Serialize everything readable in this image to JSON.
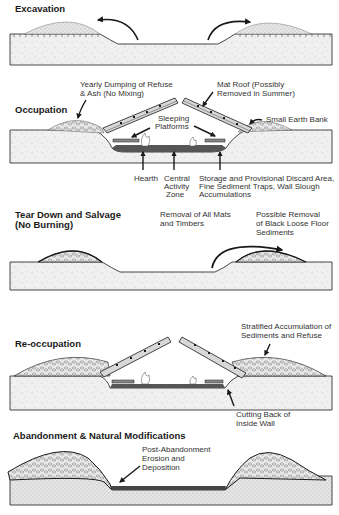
{
  "panels": [
    {
      "id": "excavation",
      "title": [
        "Excavation"
      ],
      "labels": []
    },
    {
      "id": "occupation",
      "title": [
        "Occupation"
      ],
      "labels": [
        {
          "lines": [
            "Yearly Dumping of Refuse",
            "& Ash (No Mixing)"
          ]
        },
        {
          "lines": [
            "Mat Roof (Possibly",
            "Removed in Summer)"
          ]
        },
        {
          "lines": [
            "Small Earth Bank"
          ]
        },
        {
          "lines": [
            "Sleeping",
            "Platforms"
          ]
        },
        {
          "lines": [
            "Hearth"
          ]
        },
        {
          "lines": [
            "Central",
            "Activity",
            "Zone"
          ]
        },
        {
          "lines": [
            "Storage and Provisional Discard Area,",
            "Fine Sediment Traps, Wall Slough",
            "Accumulations"
          ]
        }
      ]
    },
    {
      "id": "tear-down",
      "title": [
        "Tear Down and Salvage",
        "(No Burning)"
      ],
      "labels": [
        {
          "lines": [
            "Removal of All Mats",
            "and Timbers"
          ]
        },
        {
          "lines": [
            "Possible Removal",
            "of Black Loose Floor",
            "Sediments"
          ]
        }
      ]
    },
    {
      "id": "re-occupation",
      "title": [
        "Re-occupation"
      ],
      "labels": [
        {
          "lines": [
            "Stratified Accumulation of",
            "Sediments and Refuse"
          ]
        },
        {
          "lines": [
            "Cutting Back of",
            "Inside Wall"
          ]
        }
      ]
    },
    {
      "id": "abandonment",
      "title": [
        "Abandonment & Natural Modifications"
      ],
      "labels": [
        {
          "lines": [
            "Post-Abandonment",
            "Erosion and",
            "Deposition"
          ]
        }
      ]
    }
  ],
  "colors": {
    "ink": "#1a1a1a",
    "ground": "#ececec",
    "spoil": "#dcdcdc",
    "floor": "#555555"
  }
}
